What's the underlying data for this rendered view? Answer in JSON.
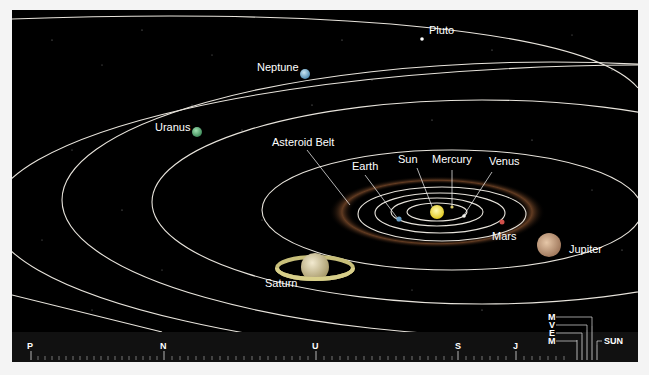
{
  "diagram": {
    "labels": {
      "pluto": "Pluto",
      "neptune": "Neptune",
      "uranus": "Uranus",
      "asteroid_belt": "Asteroid Belt",
      "earth": "Earth",
      "sun": "Sun",
      "mercury": "Mercury",
      "venus": "Venus",
      "mars": "Mars",
      "jupiter": "Jupiter",
      "saturn": "Saturn"
    },
    "colors": {
      "background": "#000000",
      "orbit": "#e8e4dc",
      "sun": "#f2e14a",
      "earth": "#6aa0c8",
      "mars": "#d0504a",
      "jupiter": "#c9a487",
      "saturn": "#d8cfa0",
      "uranus": "#5fb07c",
      "neptune": "#7fb4d4",
      "asteroid": "#8a5a3a"
    }
  },
  "scale_bar": {
    "markers": [
      {
        "key": "P",
        "label": "P"
      },
      {
        "key": "N",
        "label": "N"
      },
      {
        "key": "U",
        "label": "U"
      },
      {
        "key": "S",
        "label": "S"
      },
      {
        "key": "J",
        "label": "J"
      }
    ],
    "inner_labels": {
      "m1": "M",
      "v": "V",
      "e": "E",
      "m2": "M",
      "sun": "SUN"
    }
  }
}
